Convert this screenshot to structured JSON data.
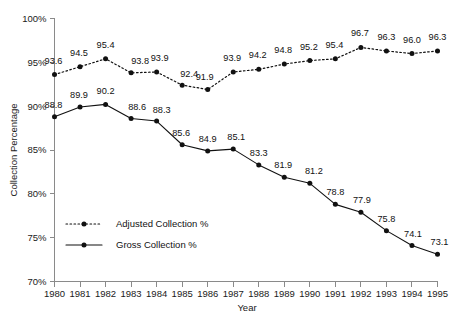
{
  "chart_data": {
    "type": "line",
    "title": "",
    "xlabel": "Year",
    "ylabel": "Collection Percentage",
    "categories": [
      "1980",
      "1981",
      "1982",
      "1983",
      "1984",
      "1985",
      "1986",
      "1987",
      "1988",
      "1989",
      "1990",
      "1991",
      "1992",
      "1993",
      "1994",
      "1995"
    ],
    "x": [
      1980,
      1981,
      1982,
      1983,
      1984,
      1985,
      1986,
      1987,
      1988,
      1989,
      1990,
      1991,
      1992,
      1993,
      1994,
      1995
    ],
    "ylim": [
      70,
      100
    ],
    "ytick_labels": [
      "70%",
      "75%",
      "80%",
      "85%",
      "90%",
      "95%",
      "100%"
    ],
    "ytick_values": [
      70,
      75,
      80,
      85,
      90,
      95,
      100
    ],
    "grid": false,
    "legend_position": "inside-lower-left",
    "series": [
      {
        "name": "Adjusted Collection %",
        "style": "dotted",
        "marker": "filled-circle",
        "color": "#111111",
        "values": [
          93.6,
          94.5,
          95.4,
          93.8,
          93.9,
          92.4,
          91.9,
          93.9,
          94.2,
          94.8,
          95.2,
          95.4,
          96.7,
          96.3,
          96.0,
          96.3
        ],
        "labels": [
          "93.6",
          "94.5",
          "95.4",
          "93.8",
          "93.9",
          "92.4",
          "91.9",
          "93.9",
          "94.2",
          "94.8",
          "95.2",
          "95.4",
          "96.7",
          "96.3",
          "96.0",
          "96.3"
        ]
      },
      {
        "name": "Gross Collection %",
        "style": "solid",
        "marker": "filled-circle",
        "color": "#111111",
        "values": [
          88.8,
          89.9,
          90.2,
          88.6,
          88.3,
          85.6,
          84.9,
          85.1,
          83.3,
          81.9,
          81.2,
          78.8,
          77.9,
          75.8,
          74.1,
          73.1
        ],
        "labels": [
          "88.8",
          "89.9",
          "90.2",
          "88.6",
          "88.3",
          "85.6",
          "84.9",
          "85.1",
          "83.3",
          "81.9",
          "81.2",
          "78.8",
          "77.9",
          "75.8",
          "74.1",
          "73.1"
        ]
      }
    ]
  },
  "legend": {
    "items": [
      {
        "label": "Adjusted Collection %",
        "style": "dotted"
      },
      {
        "label": "Gross Collection %",
        "style": "solid"
      }
    ]
  }
}
